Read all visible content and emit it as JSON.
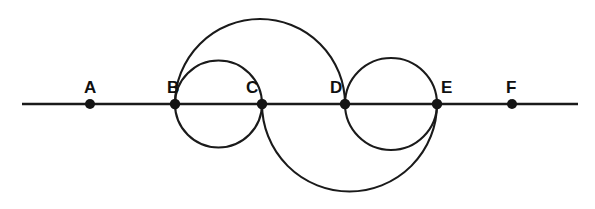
{
  "figure": {
    "background_color": "#ffffff",
    "stroke_color": "#1a1a1a",
    "width": 595,
    "height": 209
  },
  "baseline": {
    "name": "horizontal-line",
    "y": 104,
    "x_start": 22,
    "x_end": 578,
    "stroke_width": 2.6
  },
  "points": [
    {
      "label": "A",
      "x": 90,
      "y": 104,
      "label_x": 84,
      "label_y": 93,
      "radius": 5.0
    },
    {
      "label": "B",
      "x": 175,
      "y": 104,
      "label_x": 167,
      "label_y": 93,
      "radius": 5.2
    },
    {
      "label": "C",
      "x": 262,
      "y": 104,
      "label_x": 246,
      "label_y": 93,
      "radius": 5.2
    },
    {
      "label": "D",
      "x": 345,
      "y": 104,
      "label_x": 330,
      "label_y": 93,
      "radius": 5.2
    },
    {
      "label": "E",
      "x": 437,
      "y": 104,
      "label_x": 441,
      "label_y": 93,
      "radius": 5.2
    },
    {
      "label": "F",
      "x": 512,
      "y": 104,
      "label_x": 506,
      "label_y": 93,
      "radius": 5.0
    }
  ],
  "circles": [
    {
      "name": "circle-bc",
      "endpoints": "B-C",
      "cx": 218.5,
      "cy": 104,
      "r": 43.5,
      "arc": "full",
      "stroke_width": 2.1
    },
    {
      "name": "circle-de",
      "endpoints": "D-E",
      "cx": 391,
      "cy": 104,
      "r": 46,
      "arc": "full",
      "stroke_width": 2.1
    },
    {
      "name": "arc-ce-upper",
      "endpoints": "C-E",
      "cx": 349.5,
      "cy": 104,
      "r": 87.5,
      "arc": "upper",
      "stroke_width": 2.1
    },
    {
      "name": "arc-bd-lower",
      "endpoints": "B-D",
      "cx": 260,
      "cy": 104,
      "r": 85,
      "arc": "lower",
      "stroke_width": 2.1
    }
  ]
}
